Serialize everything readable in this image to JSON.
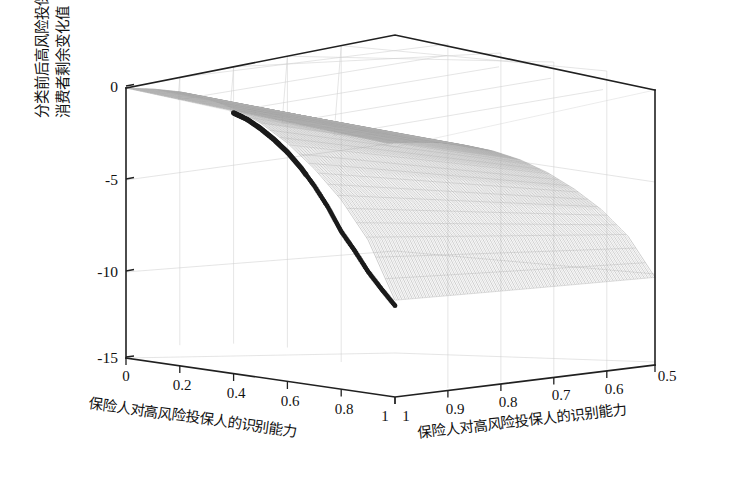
{
  "figure": {
    "title": "",
    "background": "#ffffff",
    "curve_color": "#1b1b1b",
    "mesh_color": "#8d8d8d",
    "axis_color": "#202020"
  },
  "axes": {
    "z": {
      "label_line1": "分类前后高风险投保人",
      "label_line2": "消费者剩余变化值",
      "ticks": [
        "0",
        "-5",
        "-10",
        "-15"
      ],
      "tick_values": [
        0,
        -5,
        -10,
        -15
      ],
      "range": [
        -15,
        0
      ]
    },
    "x_left": {
      "label": "保险人对高风险投保人的识别能力",
      "ticks": [
        "0",
        "0.2",
        "0.4",
        "0.6",
        "0.8",
        "1"
      ],
      "tick_values": [
        0,
        0.2,
        0.4,
        0.6,
        0.8,
        1
      ],
      "range": [
        0,
        1
      ]
    },
    "x_right": {
      "label": "保险人对高风险投保人的识别能力",
      "ticks": [
        "1",
        "0.9",
        "0.8",
        "0.7",
        "0.6",
        "0.5"
      ],
      "tick_values": [
        1,
        0.9,
        0.8,
        0.7,
        0.6,
        0.5
      ],
      "range": [
        1,
        0.5
      ]
    }
  },
  "chart_data": {
    "type": "surface3d",
    "title": "",
    "xlabel": "保险人对高风险投保人的识别能力",
    "ylabel": "保险人对高风险投保人的识别能力",
    "zlabel": "分类前后高风险投保人消费者剩余变化值",
    "xlim": [
      0,
      1
    ],
    "ylim": [
      0.5,
      1
    ],
    "zlim": [
      -15,
      0
    ],
    "xticks": [
      0,
      0.2,
      0.4,
      0.6,
      0.8,
      1
    ],
    "yticks": [
      1,
      0.9,
      0.8,
      0.7,
      0.6,
      0.5
    ],
    "zticks": [
      0,
      -5,
      -10,
      -15
    ],
    "grid": true,
    "legend": "none",
    "surface": {
      "description": "Monotonically decreasing surface from z=0 at x=0 down to about z=-15 near x=1; mesh drawn as fine hatch lines, light gray.",
      "z_at_x": [
        0,
        -0.35,
        -0.8,
        -1.45,
        -2.3,
        -3.4,
        -4.8,
        -6.5,
        -8.5,
        -11.0,
        -14.6
      ],
      "x_samples": [
        0,
        0.1,
        0.2,
        0.3,
        0.4,
        0.5,
        0.6,
        0.7,
        0.8,
        0.9,
        1.0
      ]
    },
    "highlight_curve": {
      "name": "主曲线",
      "style": "dotted-thick",
      "color": "#1b1b1b",
      "x": [
        0.4,
        0.45,
        0.5,
        0.55,
        0.6,
        0.65,
        0.7,
        0.75,
        0.8,
        0.85,
        0.9,
        0.95,
        1.0
      ],
      "z": [
        -2.55,
        -3.05,
        -3.7,
        -4.45,
        -5.3,
        -6.3,
        -7.45,
        -8.75,
        -10.25,
        -11.45,
        -12.75,
        -13.85,
        -14.9
      ]
    }
  }
}
